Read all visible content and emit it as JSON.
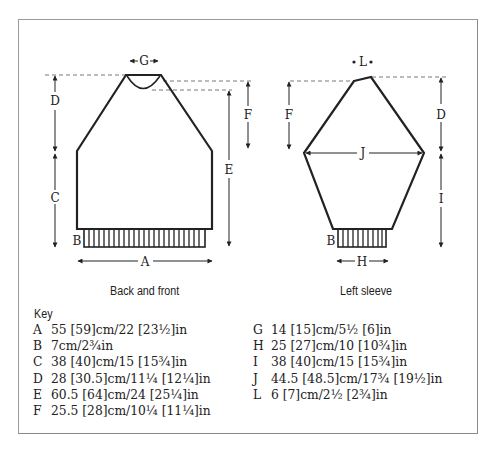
{
  "diagram": {
    "back_front": {
      "caption": "Back and front",
      "labels": {
        "G": "G",
        "D": "D",
        "C": "C",
        "F": "F",
        "E": "E",
        "B": "B",
        "A": "A"
      }
    },
    "sleeve": {
      "caption": "Left sleeve",
      "labels": {
        "L": "L",
        "F": "F",
        "D": "D",
        "J": "J",
        "I": "I",
        "B": "B",
        "H": "H"
      }
    }
  },
  "key": {
    "title": "Key",
    "left_column": [
      {
        "letter": "A",
        "value": "55 [59]cm/22 [23½]in"
      },
      {
        "letter": "B",
        "value": "7cm/2¾in"
      },
      {
        "letter": "C",
        "value": "38 [40]cm/15 [15¾]in"
      },
      {
        "letter": "D",
        "value": "28 [30.5]cm/11¼ [12¼]in"
      },
      {
        "letter": "E",
        "value": "60.5 [64]cm/24 [25¼]in"
      },
      {
        "letter": "F",
        "value": "25.5 [28]cm/10¼ [11¼]in"
      }
    ],
    "right_column": [
      {
        "letter": "G",
        "value": "14 [15]cm/5½ [6]in"
      },
      {
        "letter": "H",
        "value": "25 [27]cm/10 [10¾]in"
      },
      {
        "letter": "I",
        "value": "38 [40]cm/15 [15¾]in"
      },
      {
        "letter": "J",
        "value": "44.5 [48.5]cm/17¾ [19½]in"
      },
      {
        "letter": "L",
        "value": "6 [7]cm/2½ [2¾]in"
      }
    ]
  }
}
